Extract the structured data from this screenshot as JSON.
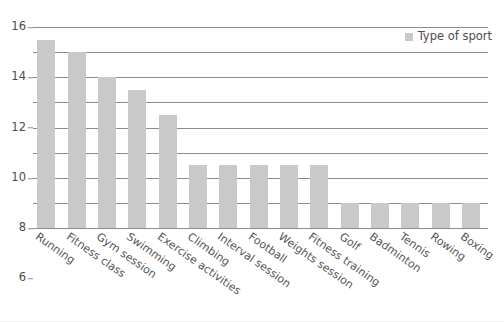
{
  "chart_data": {
    "type": "bar",
    "title": "",
    "subtitle": "",
    "xlabel": "",
    "ylabel": "",
    "ylim": [
      0,
      16
    ],
    "ytick_step": 2,
    "yticks": [
      0,
      2,
      4,
      6,
      8,
      10,
      12,
      14,
      16
    ],
    "grid": true,
    "legend_position": "top-right",
    "categories": [
      "Running",
      "Fitness class",
      "Gym session",
      "Swimming",
      "Exercise activities",
      "Climbing",
      "Interval session",
      "Football",
      "Weights session",
      "Fitness training",
      "Golf",
      "Badminton",
      "Tennis",
      "Rowing",
      "Boxing"
    ],
    "values": [
      15,
      14,
      12,
      11,
      9,
      5,
      5,
      5,
      5,
      5,
      2,
      2,
      2,
      2,
      2
    ],
    "series": [
      {
        "name": "Type of sport",
        "values": [
          15,
          14,
          12,
          11,
          9,
          5,
          5,
          5,
          5,
          5,
          2,
          2,
          2,
          2,
          2
        ]
      }
    ]
  },
  "legend": {
    "entries": [
      {
        "label": "Type of sport",
        "color": "#c9c9c9"
      }
    ]
  },
  "colors": {
    "bar": "#c9c9c9",
    "gridline": "#8c8c8c",
    "axis": "#8c8c8c",
    "tick_text": "#4d4d4d",
    "xlabel_text": "#555555",
    "background": "#ffffff"
  }
}
